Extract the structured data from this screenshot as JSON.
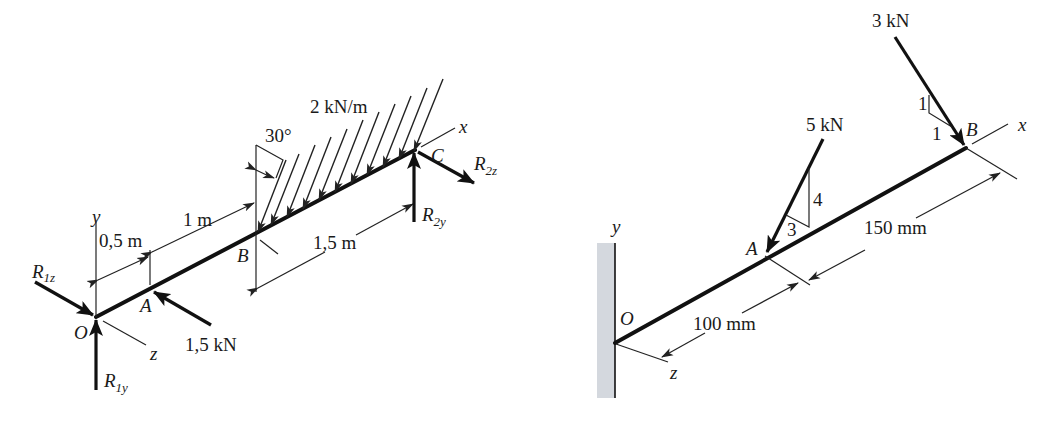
{
  "figure_left": {
    "title": "Simply supported shaft with distributed load",
    "axes": {
      "x": "x",
      "y": "y",
      "z": "z"
    },
    "points": {
      "O": "O",
      "A": "A",
      "B": "B",
      "C": "C"
    },
    "reactions": {
      "R1z": {
        "main": "R",
        "sub": "1z"
      },
      "R1y": {
        "main": "R",
        "sub": "1y"
      },
      "R2y": {
        "main": "R",
        "sub": "2y"
      },
      "R2z": {
        "main": "R",
        "sub": "2z"
      }
    },
    "loads": {
      "point_force": "1,5 kN",
      "distributed": "2 kN/m",
      "angle": "30°"
    },
    "dimensions": {
      "OA": "0,5 m",
      "AB": "1 m",
      "BC": "1,5 m"
    }
  },
  "figure_right": {
    "title": "Cantilever with inclined point loads",
    "axes": {
      "x": "x",
      "y": "y",
      "z": "z"
    },
    "points": {
      "O": "O",
      "A": "A",
      "B": "B"
    },
    "loads": {
      "force_A": "5 kN",
      "force_B": "3 kN",
      "slope_A": {
        "rise": "4",
        "run": "3"
      },
      "slope_B": {
        "rise": "1",
        "run": "1"
      }
    },
    "dimensions": {
      "OA": "100 mm",
      "AB": "150 mm"
    },
    "colors": {
      "wall": "#d4d8de",
      "line": "#111111"
    }
  }
}
